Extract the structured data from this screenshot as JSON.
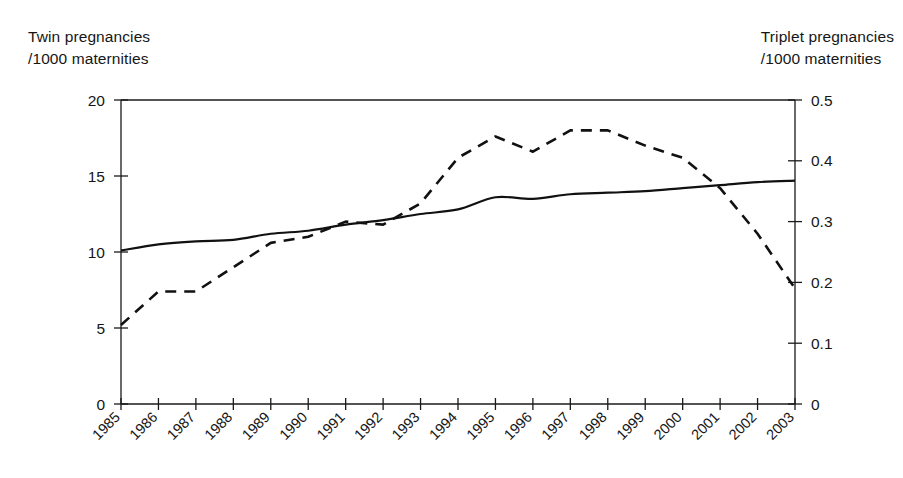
{
  "axis_titles": {
    "left": "Twin pregnancies\n/1000 maternities",
    "right": "Triplet pregnancies\n/1000 maternities"
  },
  "chart_data": {
    "type": "line",
    "title": "",
    "xlabel": "",
    "ylabel": "Twin pregnancies /1000 maternities",
    "y2label": "Triplet pregnancies /1000 maternities",
    "grid": false,
    "legend": "none",
    "ylim": [
      0,
      20
    ],
    "y2lim": [
      0,
      0.5
    ],
    "yticks": [
      "0",
      "5",
      "10",
      "15",
      "20"
    ],
    "y2ticks": [
      "0",
      "0.1",
      "0.2",
      "0.3",
      "0.4",
      "0.5"
    ],
    "categories": [
      "1985",
      "1986",
      "1987",
      "1988",
      "1989",
      "1990",
      "1991",
      "1992",
      "1993",
      "1994",
      "1995",
      "1996",
      "1997",
      "1998",
      "1999",
      "2000",
      "2001",
      "2002",
      "2003"
    ],
    "series": [
      {
        "name": "Twin pregnancies /1000 maternities",
        "axis": "left",
        "style": "solid",
        "values": [
          10.1,
          10.5,
          10.7,
          10.8,
          11.2,
          11.4,
          11.8,
          12.1,
          12.5,
          12.8,
          13.6,
          13.5,
          13.8,
          13.9,
          14.0,
          14.2,
          14.4,
          14.6,
          14.7
        ]
      },
      {
        "name": "Triplet pregnancies /1000 maternities",
        "axis": "right",
        "style": "dashed",
        "values": [
          0.13,
          0.185,
          0.185,
          0.225,
          0.265,
          0.275,
          0.3,
          0.295,
          0.33,
          0.405,
          0.44,
          0.415,
          0.45,
          0.45,
          0.425,
          0.405,
          0.355,
          0.28,
          0.19
        ]
      }
    ]
  }
}
